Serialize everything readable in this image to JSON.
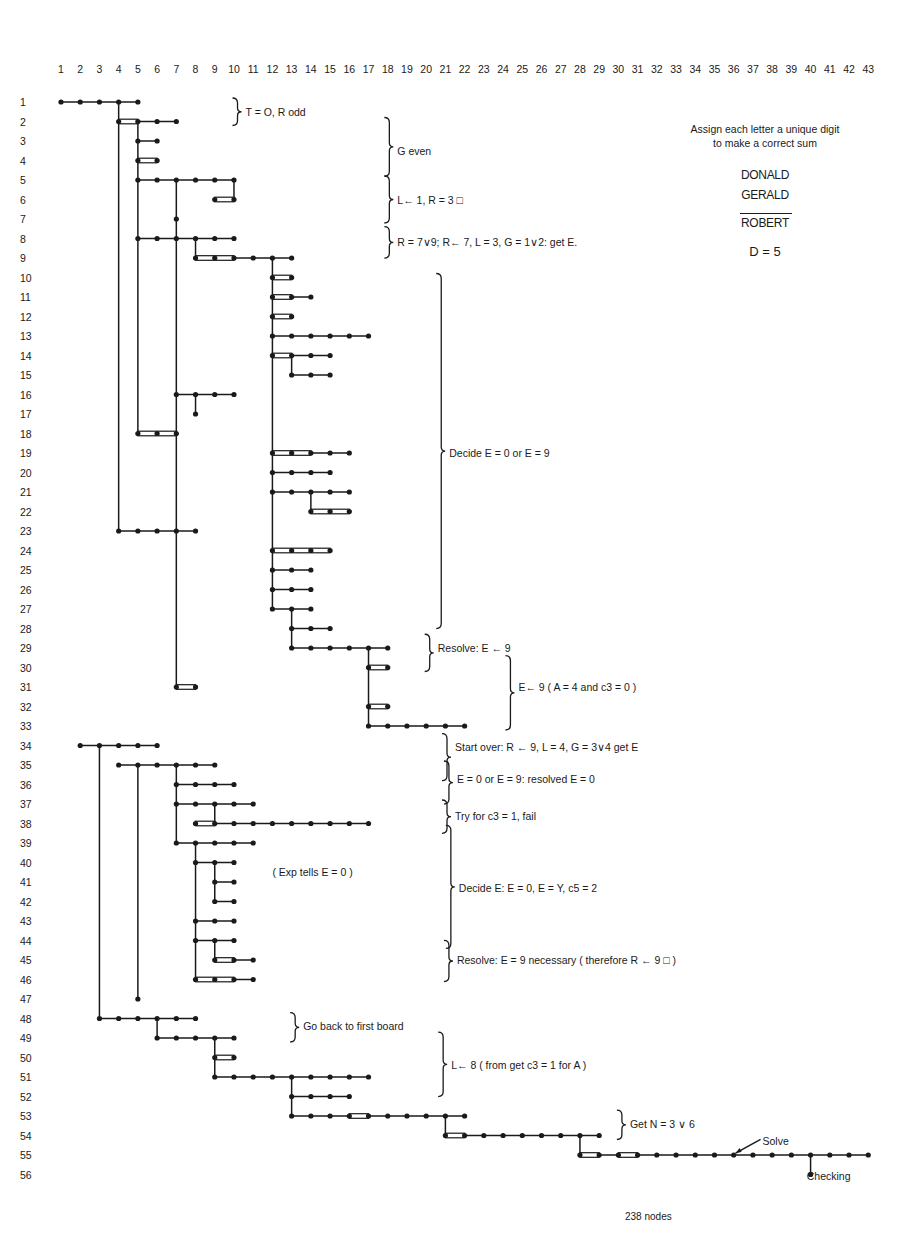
{
  "grid": {
    "columns": [
      "1",
      "2",
      "3",
      "4",
      "5",
      "6",
      "7",
      "8",
      "9",
      "10",
      "11",
      "12",
      "13",
      "14",
      "15",
      "16",
      "17",
      "18",
      "19",
      "20",
      "21",
      "22",
      "23",
      "24",
      "25",
      "26",
      "27",
      "28",
      "29",
      "30",
      "31",
      "32",
      "33",
      "34",
      "35",
      "36",
      "37",
      "38",
      "39",
      "40",
      "41",
      "42",
      "43"
    ],
    "rows": [
      "1",
      "2",
      "3",
      "4",
      "5",
      "6",
      "7",
      "8",
      "9",
      "10",
      "11",
      "12",
      "13",
      "14",
      "15",
      "16",
      "17",
      "18",
      "19",
      "20",
      "21",
      "22",
      "23",
      "24",
      "25",
      "26",
      "27",
      "28",
      "29",
      "30",
      "31",
      "32",
      "33",
      "34",
      "35",
      "36",
      "37",
      "38",
      "39",
      "40",
      "41",
      "42",
      "43",
      "44",
      "45",
      "46",
      "47",
      "48",
      "49",
      "50",
      "51",
      "52",
      "53",
      "54",
      "55",
      "56"
    ]
  },
  "puzzle": {
    "instruction_line1": "Assign each letter a unique digit",
    "instruction_line2": "to make a correct sum",
    "addend1": "DONALD",
    "addend2": "GERALD",
    "result": "ROBERT",
    "given": "D = 5"
  },
  "annotations": [
    {
      "id": "a1",
      "text": "T = O, R odd",
      "row": 1.5,
      "col": 10.6,
      "brace_from": 1,
      "brace_to": 2
    },
    {
      "id": "a2",
      "text": "G even",
      "row": 3.5,
      "col": 18.5,
      "brace_from": 2,
      "brace_to": 4.6
    },
    {
      "id": "a3",
      "text": "L← 1, R = 3 □",
      "row": 6,
      "col": 18.5,
      "brace_from": 5,
      "brace_to": 7
    },
    {
      "id": "a4",
      "text": "R = 7∨9;  R← 7, L = 3,  G = 1∨2: get E.",
      "row": 8.2,
      "col": 18.5,
      "brace_from": 7.6,
      "brace_to": 8.8
    },
    {
      "id": "a5",
      "text": "Decide E = 0 or E = 9",
      "row": 19,
      "col": 21.2,
      "brace_from": 10,
      "brace_to": 27.8
    },
    {
      "id": "a6",
      "text": "Resolve: E ← 9",
      "row": 29,
      "col": 20.6,
      "brace_from": 28.5,
      "brace_to": 30
    },
    {
      "id": "a7",
      "text": "E← 9  ( A = 4 and c3 = 0 )",
      "row": 31,
      "col": 24.8,
      "brace_from": 29.6,
      "brace_to": 33
    },
    {
      "id": "a8",
      "text": "Start over:  R ← 9,  L = 4,  G = 3∨4 get E",
      "row": 34.1,
      "col": 21.5,
      "brace_from": 33.6,
      "brace_to": 35.6
    },
    {
      "id": "a9",
      "text": "E = 0 or E = 9: resolved E = 0",
      "row": 35.7,
      "col": 21.6,
      "brace_from": 35,
      "brace_to": 36.8
    },
    {
      "id": "a10",
      "text": "Try for c3 = 1,  fail",
      "row": 37.6,
      "col": 21.5,
      "brace_from": 37,
      "brace_to": 38.3
    },
    {
      "id": "a11",
      "text": "( Exp tells E = 0   )",
      "row": 40.5,
      "col": 12.0,
      "brace_from": null,
      "brace_to": null
    },
    {
      "id": "a12",
      "text": "Decide E: E = 0, E = Y, c5 = 2",
      "row": 41.3,
      "col": 21.7,
      "brace_from": 38.3,
      "brace_to": 44.2
    },
    {
      "id": "a13",
      "text": "Resolve: E = 9 necessary ( therefore R ← 9 □ )",
      "row": 45,
      "col": 21.6,
      "brace_from": 44.2,
      "brace_to": 45.9
    },
    {
      "id": "a14",
      "text": "Go back to first board",
      "row": 48.4,
      "col": 13.6,
      "brace_from": 47.9,
      "brace_to": 49
    },
    {
      "id": "a15",
      "text": "L←  8 ( from get c3 = 1 for A )",
      "row": 50.4,
      "col": 21.3,
      "brace_from": 48.9,
      "brace_to": 51.8
    },
    {
      "id": "a16",
      "text": "Get N = 3 ∨ 6",
      "row": 53.4,
      "col": 30.6,
      "brace_from": 52.9,
      "brace_to": 54
    },
    {
      "id": "a17",
      "text": "Solve",
      "row": 54.3,
      "col": 37.5,
      "brace_from": null,
      "brace_to": null
    },
    {
      "id": "a18",
      "text": "Checking",
      "row": 56.1,
      "col": 39.8,
      "brace_from": null,
      "brace_to": null
    }
  ],
  "footer": {
    "node_count": "238  nodes"
  },
  "chart_data": {
    "type": "tree",
    "xlabel": "Column (step index 1-43)",
    "ylabel": "Row (line 1-56)",
    "total_nodes": 238,
    "segments": [
      {
        "row": 1,
        "from": 1,
        "to": 5,
        "double": []
      },
      {
        "row": 2,
        "from": 4,
        "to": 7,
        "double": [
          [
            4,
            5
          ]
        ]
      },
      {
        "row": 3,
        "from": 5,
        "to": 6,
        "double": []
      },
      {
        "row": 4,
        "from": 5,
        "to": 6,
        "double": [
          [
            5,
            6
          ]
        ]
      },
      {
        "row": 5,
        "from": 5,
        "to": 10,
        "double": []
      },
      {
        "row": 6,
        "from": 9,
        "to": 10,
        "double": [
          [
            9,
            10
          ]
        ]
      },
      {
        "row": 7,
        "from": 7,
        "to": 7,
        "double": []
      },
      {
        "row": 8,
        "from": 5,
        "to": 10,
        "double": []
      },
      {
        "row": 9,
        "from": 8,
        "to": 13,
        "double": [
          [
            8,
            10
          ]
        ]
      },
      {
        "row": 10,
        "from": 12,
        "to": 13,
        "double": [
          [
            12,
            13
          ]
        ]
      },
      {
        "row": 11,
        "from": 12,
        "to": 14,
        "double": [
          [
            12,
            13
          ]
        ]
      },
      {
        "row": 12,
        "from": 12,
        "to": 13,
        "double": [
          [
            12,
            13
          ]
        ]
      },
      {
        "row": 13,
        "from": 12,
        "to": 17,
        "double": []
      },
      {
        "row": 14,
        "from": 12,
        "to": 15,
        "double": [
          [
            12,
            13
          ]
        ]
      },
      {
        "row": 15,
        "from": 13,
        "to": 15,
        "double": []
      },
      {
        "row": 16,
        "from": 7,
        "to": 10,
        "double": []
      },
      {
        "row": 17,
        "from": 8,
        "to": 8,
        "double": []
      },
      {
        "row": 18,
        "from": 5,
        "to": 7,
        "double": [
          [
            5,
            7
          ]
        ]
      },
      {
        "row": 19,
        "from": 12,
        "to": 16,
        "double": [
          [
            12,
            14
          ]
        ]
      },
      {
        "row": 20,
        "from": 12,
        "to": 15,
        "double": []
      },
      {
        "row": 21,
        "from": 12,
        "to": 16,
        "double": []
      },
      {
        "row": 22,
        "from": 14,
        "to": 16,
        "double": [
          [
            14,
            16
          ]
        ]
      },
      {
        "row": 23,
        "from": 4,
        "to": 8,
        "double": []
      },
      {
        "row": 24,
        "from": 12,
        "to": 15,
        "double": [
          [
            12,
            15
          ]
        ]
      },
      {
        "row": 25,
        "from": 12,
        "to": 14,
        "double": []
      },
      {
        "row": 26,
        "from": 12,
        "to": 14,
        "double": []
      },
      {
        "row": 27,
        "from": 12,
        "to": 14,
        "double": []
      },
      {
        "row": 28,
        "from": 13,
        "to": 15,
        "double": []
      },
      {
        "row": 29,
        "from": 13,
        "to": 18,
        "double": []
      },
      {
        "row": 30,
        "from": 17,
        "to": 18,
        "double": [
          [
            17,
            18
          ]
        ]
      },
      {
        "row": 31,
        "from": 7,
        "to": 8,
        "double": [
          [
            7,
            8
          ]
        ]
      },
      {
        "row": 32,
        "from": 17,
        "to": 18,
        "double": [
          [
            17,
            18
          ]
        ]
      },
      {
        "row": 33,
        "from": 17,
        "to": 22,
        "double": []
      },
      {
        "row": 34,
        "from": 2,
        "to": 6,
        "double": []
      },
      {
        "row": 35,
        "from": 4,
        "to": 9,
        "double": []
      },
      {
        "row": 36,
        "from": 7,
        "to": 10,
        "double": []
      },
      {
        "row": 37,
        "from": 7,
        "to": 11,
        "double": []
      },
      {
        "row": 38,
        "from": 8,
        "to": 17,
        "double": [
          [
            8,
            9
          ]
        ]
      },
      {
        "row": 39,
        "from": 7,
        "to": 11,
        "double": []
      },
      {
        "row": 40,
        "from": 8,
        "to": 10,
        "double": []
      },
      {
        "row": 41,
        "from": 9,
        "to": 10,
        "double": []
      },
      {
        "row": 42,
        "from": 9,
        "to": 10,
        "double": []
      },
      {
        "row": 43,
        "from": 8,
        "to": 10,
        "double": []
      },
      {
        "row": 44,
        "from": 8,
        "to": 10,
        "double": []
      },
      {
        "row": 45,
        "from": 9,
        "to": 11,
        "double": [
          [
            9,
            10
          ]
        ]
      },
      {
        "row": 46,
        "from": 8,
        "to": 11,
        "double": [
          [
            8,
            10
          ]
        ]
      },
      {
        "row": 47,
        "from": 5,
        "to": 5,
        "double": []
      },
      {
        "row": 48,
        "from": 3,
        "to": 8,
        "double": []
      },
      {
        "row": 49,
        "from": 6,
        "to": 10,
        "double": []
      },
      {
        "row": 50,
        "from": 9,
        "to": 10,
        "double": [
          [
            9,
            10
          ]
        ]
      },
      {
        "row": 51,
        "from": 9,
        "to": 17,
        "double": []
      },
      {
        "row": 52,
        "from": 13,
        "to": 16,
        "double": []
      },
      {
        "row": 53,
        "from": 13,
        "to": 22,
        "double": [
          [
            16,
            17
          ]
        ]
      },
      {
        "row": 54,
        "from": 21,
        "to": 29,
        "double": [
          [
            21,
            22
          ]
        ]
      },
      {
        "row": 55,
        "from": 28,
        "to": 43,
        "double": [
          [
            28,
            29
          ],
          [
            30,
            31
          ]
        ]
      },
      {
        "row": 56,
        "from": 40,
        "to": 40,
        "double": []
      }
    ],
    "verticals": [
      {
        "col": 4,
        "from": 1,
        "to": 23
      },
      {
        "col": 5,
        "from": 2,
        "to": 18
      },
      {
        "col": 7,
        "from": 5,
        "to": 31
      },
      {
        "col": 10,
        "from": 5,
        "to": 6
      },
      {
        "col": 8,
        "from": 8,
        "to": 9
      },
      {
        "col": 12,
        "from": 9,
        "to": 27
      },
      {
        "col": 8,
        "from": 16,
        "to": 17
      },
      {
        "col": 13,
        "from": 14,
        "to": 15
      },
      {
        "col": 14,
        "from": 21,
        "to": 22
      },
      {
        "col": 13,
        "from": 27,
        "to": 29
      },
      {
        "col": 17,
        "from": 29,
        "to": 33
      },
      {
        "col": 3,
        "from": 34,
        "to": 48
      },
      {
        "col": 5,
        "from": 35,
        "to": 47
      },
      {
        "col": 7,
        "from": 35,
        "to": 39
      },
      {
        "col": 9,
        "from": 37,
        "to": 38
      },
      {
        "col": 8,
        "from": 39,
        "to": 46
      },
      {
        "col": 9,
        "from": 40,
        "to": 42
      },
      {
        "col": 9,
        "from": 44,
        "to": 45
      },
      {
        "col": 6,
        "from": 48,
        "to": 49
      },
      {
        "col": 9,
        "from": 49,
        "to": 51
      },
      {
        "col": 13,
        "from": 51,
        "to": 53
      },
      {
        "col": 21,
        "from": 53,
        "to": 54
      },
      {
        "col": 28,
        "from": 54,
        "to": 55
      },
      {
        "col": 40,
        "from": 55,
        "to": 56
      }
    ]
  }
}
